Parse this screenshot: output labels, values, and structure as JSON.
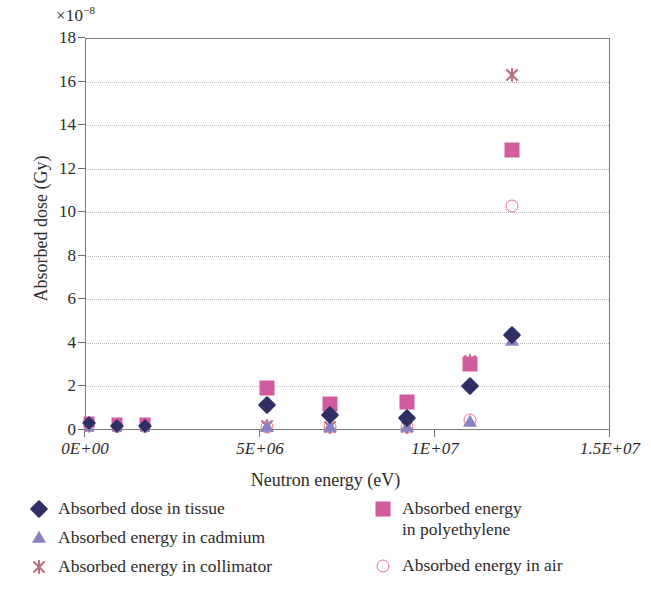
{
  "chart_data": {
    "type": "scatter",
    "title": "",
    "xlabel": "Neutron energy (eV)",
    "ylabel": "Absorbed dose (Gy)",
    "y_multiplier": "×10",
    "y_multiplier_exponent": "−8",
    "xlim": [
      0,
      15000000
    ],
    "ylim": [
      0,
      18
    ],
    "grid": "horizontal-dotted",
    "legend_position": "below",
    "xticks": [
      {
        "value": 0,
        "label": "0E+00"
      },
      {
        "value": 5000000,
        "label": "5E+06"
      },
      {
        "value": 10000000,
        "label": "1E+07"
      },
      {
        "value": 15000000,
        "label": "1.5E+07"
      }
    ],
    "yticks": [
      {
        "value": 0,
        "label": "0"
      },
      {
        "value": 2,
        "label": "2"
      },
      {
        "value": 4,
        "label": "4"
      },
      {
        "value": 6,
        "label": "6"
      },
      {
        "value": 8,
        "label": "8"
      },
      {
        "value": 10,
        "label": "10"
      },
      {
        "value": 12,
        "label": "12"
      },
      {
        "value": 14,
        "label": "14"
      },
      {
        "value": 16,
        "label": "16"
      },
      {
        "value": 18,
        "label": "18"
      }
    ],
    "series": [
      {
        "name": "Absorbed dose in tissue",
        "marker": "diamond",
        "color": "#2f2f66",
        "points": [
          {
            "x": 100000,
            "y": 0.3
          },
          {
            "x": 900000,
            "y": 0.2
          },
          {
            "x": 1700000,
            "y": 0.2
          },
          {
            "x": 5200000,
            "y": 1.15
          },
          {
            "x": 7000000,
            "y": 0.7
          },
          {
            "x": 9200000,
            "y": 0.55
          },
          {
            "x": 11000000,
            "y": 2.0
          },
          {
            "x": 12200000,
            "y": 4.35
          }
        ]
      },
      {
        "name": "Absorbed energy in polyethylene",
        "marker": "square",
        "color": "#d05c9d",
        "points": [
          {
            "x": 100000,
            "y": 0.35
          },
          {
            "x": 900000,
            "y": 0.3
          },
          {
            "x": 1700000,
            "y": 0.3
          },
          {
            "x": 5200000,
            "y": 1.95
          },
          {
            "x": 7000000,
            "y": 1.2
          },
          {
            "x": 9200000,
            "y": 1.3
          },
          {
            "x": 11000000,
            "y": 3.05
          },
          {
            "x": 12200000,
            "y": 12.85
          }
        ]
      },
      {
        "name": "Absorbed energy in cadmium",
        "marker": "triangle",
        "color": "#8b7fc4",
        "points": [
          {
            "x": 100000,
            "y": 0.1
          },
          {
            "x": 900000,
            "y": 0.08
          },
          {
            "x": 1700000,
            "y": 0.08
          },
          {
            "x": 5200000,
            "y": 0.15
          },
          {
            "x": 7000000,
            "y": 0.12
          },
          {
            "x": 9200000,
            "y": 0.12
          },
          {
            "x": 11000000,
            "y": 0.35
          },
          {
            "x": 12200000,
            "y": 4.1
          }
        ]
      },
      {
        "name": "Absorbed energy in collimator",
        "marker": "star",
        "color": "#b9707f",
        "points": [
          {
            "x": 100000,
            "y": 0.15
          },
          {
            "x": 900000,
            "y": 0.12
          },
          {
            "x": 1700000,
            "y": 0.12
          },
          {
            "x": 5200000,
            "y": 0.18
          },
          {
            "x": 7000000,
            "y": 0.15
          },
          {
            "x": 9200000,
            "y": 0.15
          },
          {
            "x": 11000000,
            "y": 3.15
          },
          {
            "x": 12200000,
            "y": 16.3
          }
        ]
      },
      {
        "name": "Absorbed energy in air",
        "marker": "circle",
        "color": "#e8747f",
        "points": [
          {
            "x": 100000,
            "y": 0.12
          },
          {
            "x": 900000,
            "y": 0.1
          },
          {
            "x": 1700000,
            "y": 0.1
          },
          {
            "x": 5200000,
            "y": 0.16
          },
          {
            "x": 7000000,
            "y": 0.14
          },
          {
            "x": 9200000,
            "y": 0.14
          },
          {
            "x": 11000000,
            "y": 0.45
          },
          {
            "x": 12200000,
            "y": 10.3
          }
        ]
      }
    ]
  },
  "legend": {
    "left_column": [
      {
        "label": "Absorbed dose in tissue",
        "marker": "diamond",
        "color": "#2f2f66"
      },
      {
        "label": "Absorbed energy in cadmium",
        "marker": "triangle",
        "color": "#8b7fc4"
      },
      {
        "label": "Absorbed energy in collimator",
        "marker": "star",
        "color": "#b9707f"
      }
    ],
    "right_column": [
      {
        "label": "Absorbed energy\nin polyethylene",
        "marker": "square",
        "color": "#d05c9d"
      },
      {
        "label": "Absorbed energy in air",
        "marker": "circle",
        "color": "#e8747f"
      }
    ]
  }
}
